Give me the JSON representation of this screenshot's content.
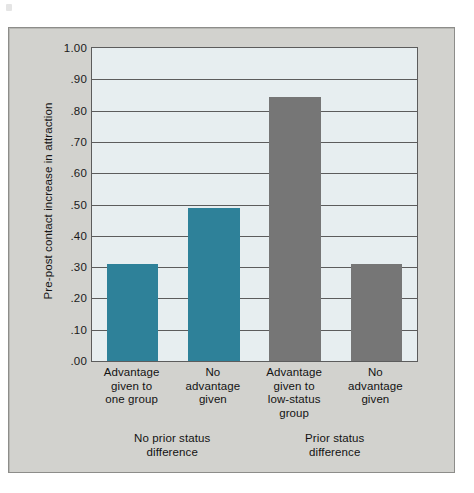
{
  "figure": {
    "panel_background": "#d2d2ce",
    "plot_background": "#e7eef0",
    "grid_color": "#5c5c5c"
  },
  "chart_data": {
    "type": "bar",
    "title": "",
    "xlabel": "",
    "ylabel": "Pre-post contact increase in attraction",
    "ylim": [
      0.0,
      1.0
    ],
    "yticks": [
      0.0,
      0.1,
      0.2,
      0.3,
      0.4,
      0.5,
      0.6,
      0.7,
      0.8,
      0.9,
      1.0
    ],
    "ytick_labels": [
      ".00",
      ".10",
      ".20",
      ".30",
      ".40",
      ".50",
      ".60",
      ".70",
      ".80",
      ".90",
      "1.00"
    ],
    "grid": true,
    "grid_axis": "y",
    "legend": false,
    "categories": [
      "Advantage\ngiven to\none group",
      "No\nadvantage\ngiven",
      "Advantage\ngiven to\nlow-status\ngroup",
      "No\nadvantage\ngiven"
    ],
    "values": [
      0.31,
      0.49,
      0.845,
      0.31
    ],
    "bar_colors": [
      "#2e8199",
      "#2e8199",
      "#767676",
      "#767676"
    ],
    "groups": [
      {
        "label": "No prior status\ndifference",
        "categories": [
          0,
          1
        ]
      },
      {
        "label": "Prior status\ndifference",
        "categories": [
          2,
          3
        ]
      }
    ]
  }
}
